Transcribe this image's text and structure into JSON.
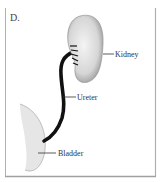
{
  "figure": {
    "panel_label": "D.",
    "labels": {
      "kidney": "Kidney",
      "ureter": "Ureter",
      "bladder": "Bladder"
    },
    "colors": {
      "frame": "#b0b0b0",
      "organ_fill": "#e2e2e2",
      "organ_outline": "#888888",
      "ureter": "#111111",
      "text": "#333333"
    }
  }
}
